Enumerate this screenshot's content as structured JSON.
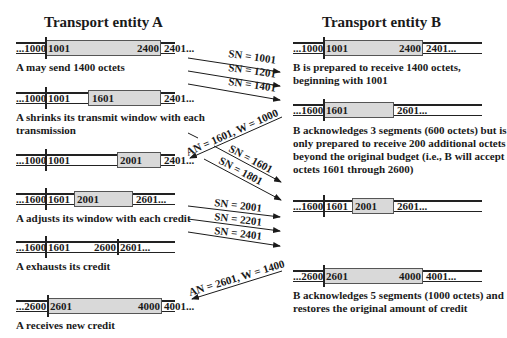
{
  "entity_a": {
    "title": "Transport entity A",
    "rows": [
      {
        "before": "...1000",
        "first": "1001",
        "mid": "",
        "last": "2400",
        "after": "2401...",
        "caption": [
          "A may send 1400 octets"
        ]
      },
      {
        "before": "...1000",
        "first": "1001",
        "mid": "1601",
        "last": "",
        "after": "2401...",
        "caption": [
          "A shrinks its transmit window with each",
          "transmission"
        ]
      },
      {
        "before": "...1000",
        "first": "1001",
        "mid": "2001",
        "last": "",
        "after": "2401...",
        "caption": []
      },
      {
        "before": "...1600",
        "first": "1601",
        "mid": "2001",
        "last": "",
        "after": "2601...",
        "caption": [
          "A adjusts its window with each credit"
        ]
      },
      {
        "before": "...1600",
        "first": "1601",
        "mid": "",
        "last": "2600",
        "after": "2601...",
        "caption": [
          "A exhausts its credit"
        ]
      },
      {
        "before": "...2600",
        "first": "2601",
        "mid": "",
        "last": "4000",
        "after": "4001...",
        "caption": [
          "A receives new credit"
        ]
      }
    ]
  },
  "entity_b": {
    "title": "Transport entity B",
    "rows": [
      {
        "before": "...1000",
        "first": "1001",
        "mid": "",
        "last": "2400",
        "after": "2401...",
        "caption": [
          "B is prepared to receive 1400 octets,",
          "beginning with 1001"
        ]
      },
      {
        "before": "...1600",
        "first": "1601",
        "mid": "",
        "last": "",
        "after": "2601...",
        "caption": [
          "B acknowledges 3 segments (600 octets) but is",
          "only prepared to receive 200 additional octets",
          "beyond the original budget (i.e., B will accept",
          "octets 1601 through 2600)"
        ]
      },
      {
        "before": "...1600",
        "first": "1601",
        "mid": "2001",
        "last": "",
        "after": "2601...",
        "caption": []
      },
      {
        "before": "...2600",
        "first": "2601",
        "mid": "",
        "last": "4000",
        "after": "4001...",
        "caption": [
          "B acknowledges 5 segments (1000 octets) and",
          "restores the original amount of credit"
        ]
      }
    ]
  },
  "messages": [
    {
      "direction": "A->B",
      "label": "SN = 1001"
    },
    {
      "direction": "A->B",
      "label": "SN = 1201"
    },
    {
      "direction": "A->B",
      "label": "SN = 1401"
    },
    {
      "direction": "B->A",
      "label": "AN = 1601, W = 1000"
    },
    {
      "direction": "A->B",
      "label": "SN = 1601"
    },
    {
      "direction": "A->B",
      "label": "SN = 1801"
    },
    {
      "direction": "A->B",
      "label": "SN = 2001"
    },
    {
      "direction": "A->B",
      "label": "SN = 2201"
    },
    {
      "direction": "A->B",
      "label": "SN = 2401"
    },
    {
      "direction": "B->A",
      "label": "AN = 2601, W = 1400"
    }
  ]
}
